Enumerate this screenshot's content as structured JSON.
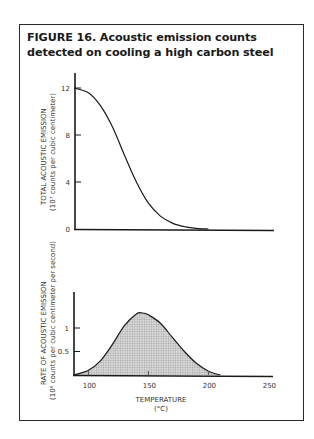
{
  "figure": {
    "title": "FIGURE 16. Acoustic emission counts detected on cooling a high carbon steel"
  },
  "chart_data": [
    {
      "type": "line",
      "title": "FIGURE 16. Acoustic emission counts detected on cooling a high carbon steel",
      "xlabel": "TEMPERATURE (°C)",
      "ylabel": "TOTAL ACOUSTIC EMISSION (10^7 counts per cubic centimeter)",
      "ylabel_line1": "TOTAL ACOUSTIC EMISSION",
      "ylabel_line2": "(10⁷ counts per cubic centimeter)",
      "y_ticks": [
        "0",
        "4",
        "8",
        "12"
      ],
      "ylim": [
        0,
        12
      ],
      "xlim": [
        88,
        250
      ],
      "grid": false,
      "x": [
        88,
        100,
        110,
        120,
        130,
        140,
        150,
        160,
        170,
        180,
        190,
        200,
        250
      ],
      "values": [
        12,
        11.6,
        10.5,
        8.7,
        6.3,
        4.0,
        2.2,
        1.1,
        0.5,
        0.2,
        0.05,
        0,
        0
      ]
    },
    {
      "type": "area",
      "xlabel_line1": "TEMPERATURE",
      "xlabel_line2": "(°C)",
      "xlabel": "TEMPERATURE (°C)",
      "ylabel": "RATE OF ACOUSTIC EMISSION (10^6 counts per cubic centimeter per second)",
      "ylabel_line1": "RATE OF ACOUSTIC EMISSION",
      "ylabel_line2": "(10⁶ counts per cubic centimeter per second)",
      "x_ticks": [
        "100",
        "150",
        "200",
        "250"
      ],
      "y_ticks": [
        "0.5",
        "1"
      ],
      "ylim": [
        0,
        1.5
      ],
      "xlim": [
        88,
        250
      ],
      "grid": false,
      "fill": "crosshatch",
      "x": [
        88,
        100,
        110,
        120,
        130,
        140,
        145,
        150,
        160,
        170,
        180,
        190,
        200,
        210,
        250
      ],
      "values": [
        0,
        0.1,
        0.3,
        0.65,
        1.05,
        1.3,
        1.32,
        1.28,
        1.1,
        0.8,
        0.5,
        0.25,
        0.08,
        0,
        0
      ]
    }
  ]
}
